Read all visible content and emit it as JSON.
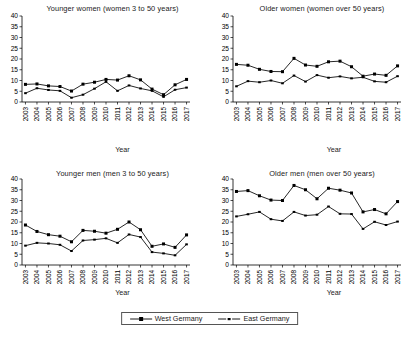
{
  "figure": {
    "axis_title": "Year",
    "y_ticks": [
      0,
      5,
      10,
      15,
      20,
      25,
      30,
      35,
      40
    ],
    "years": [
      "2003",
      "2004",
      "2005",
      "2006",
      "2007",
      "2008",
      "2009",
      "2010",
      "2011",
      "2012",
      "2013",
      "2014",
      "2015",
      "2016",
      "2017"
    ],
    "legend": {
      "items": [
        {
          "label": "West Germany",
          "marker": "filled-square",
          "color": "#000000"
        },
        {
          "label": "East Germany",
          "marker": "small-dash",
          "color": "#000000"
        }
      ]
    }
  },
  "chart_data": [
    {
      "type": "line",
      "title": "Younger women (women 3 to 50 years)",
      "xlabel": "Year",
      "ylabel": "",
      "ylim": [
        0,
        40
      ],
      "grid": false,
      "legend_position": "bottom-center-shared",
      "x": [
        "2003",
        "2004",
        "2005",
        "2006",
        "2007",
        "2008",
        "2009",
        "2010",
        "2011",
        "2012",
        "2013",
        "2014",
        "2015",
        "2016",
        "2017"
      ],
      "series": [
        {
          "name": "West Germany",
          "values": [
            8.2,
            8.4,
            7.5,
            7.2,
            5.1,
            8.3,
            9.2,
            10.5,
            10.2,
            12.2,
            10.3,
            6.0,
            3.4,
            8.0,
            10.5
          ]
        },
        {
          "name": "East Germany",
          "values": [
            4.1,
            6.4,
            5.6,
            5.2,
            2.0,
            3.4,
            6.2,
            9.4,
            5.2,
            7.7,
            6.3,
            5.2,
            2.4,
            5.7,
            6.7
          ]
        }
      ]
    },
    {
      "type": "line",
      "title": "Older women (women over 50 years)",
      "xlabel": "Year",
      "ylabel": "",
      "ylim": [
        0,
        40
      ],
      "grid": false,
      "legend_position": "bottom-center-shared",
      "x": [
        "2003",
        "2004",
        "2005",
        "2006",
        "2007",
        "2008",
        "2009",
        "2010",
        "2011",
        "2012",
        "2013",
        "2014",
        "2015",
        "2016",
        "2017"
      ],
      "series": [
        {
          "name": "West Germany",
          "values": [
            17.5,
            17.1,
            15.2,
            14.2,
            14.1,
            20.3,
            17.2,
            16.6,
            18.7,
            19.0,
            16.4,
            12.0,
            13.0,
            12.4,
            16.8
          ]
        },
        {
          "name": "East Germany",
          "values": [
            7.3,
            9.7,
            9.2,
            10.0,
            8.7,
            12.3,
            9.5,
            12.5,
            11.3,
            11.9,
            11.0,
            11.5,
            9.6,
            9.2,
            12.0
          ]
        }
      ]
    },
    {
      "type": "line",
      "title": "Younger men (men 3 to 50 years)",
      "xlabel": "Year",
      "ylabel": "",
      "ylim": [
        0,
        40
      ],
      "grid": false,
      "legend_position": "bottom-center-shared",
      "x": [
        "2003",
        "2004",
        "2005",
        "2006",
        "2007",
        "2008",
        "2009",
        "2010",
        "2011",
        "2012",
        "2013",
        "2014",
        "2015",
        "2016",
        "2017"
      ],
      "series": [
        {
          "name": "West Germany",
          "values": [
            18.6,
            15.6,
            14.1,
            13.4,
            10.8,
            16.1,
            15.7,
            14.8,
            16.6,
            20.0,
            16.4,
            8.7,
            9.8,
            8.2,
            14.0
          ]
        },
        {
          "name": "East Germany",
          "values": [
            9.0,
            10.3,
            10.0,
            9.4,
            6.5,
            11.4,
            11.8,
            12.4,
            10.3,
            14.2,
            13.0,
            6.0,
            5.4,
            4.5,
            9.6
          ]
        }
      ]
    },
    {
      "type": "line",
      "title": "Older men (men over 50 years)",
      "xlabel": "Year",
      "ylabel": "",
      "ylim": [
        0,
        40
      ],
      "grid": false,
      "legend_position": "bottom-center-shared",
      "x": [
        "2003",
        "2004",
        "2005",
        "2006",
        "2007",
        "2008",
        "2009",
        "2010",
        "2011",
        "2012",
        "2013",
        "2014",
        "2015",
        "2016",
        "2017"
      ],
      "series": [
        {
          "name": "West Germany",
          "values": [
            34.2,
            34.6,
            32.2,
            30.2,
            30.0,
            37.0,
            35.0,
            30.8,
            35.7,
            34.8,
            33.5,
            24.7,
            25.8,
            23.8,
            29.5
          ]
        },
        {
          "name": "East Germany",
          "values": [
            22.6,
            23.6,
            24.7,
            21.3,
            20.5,
            24.7,
            23.0,
            23.4,
            27.2,
            23.8,
            23.7,
            16.8,
            20.1,
            18.6,
            20.2
          ]
        }
      ]
    }
  ]
}
